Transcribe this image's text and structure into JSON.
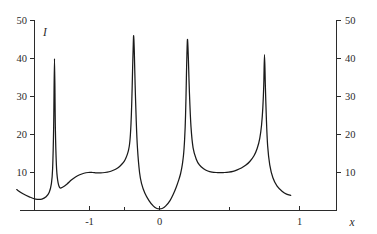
{
  "figure": {
    "title": "",
    "background_color": "#ffffff",
    "curve_color": "#1a1a1a",
    "axis_color": "#2b2b2b"
  },
  "axes": {
    "y_left": {
      "label": "I",
      "ticks": [
        "10",
        "20",
        "30",
        "40",
        "50"
      ],
      "tick_values": [
        10,
        20,
        30,
        40,
        50
      ]
    },
    "y_right": {
      "label": "",
      "ticks": [
        "10",
        "20",
        "30",
        "40",
        "50"
      ],
      "tick_values": [
        10,
        20,
        30,
        40,
        50
      ]
    },
    "x": {
      "label": "x",
      "ticks": [
        "-1",
        "0",
        "1"
      ],
      "tick_values": [
        -1,
        0,
        1
      ],
      "minor_tick_values": [
        -0.5,
        0.5
      ]
    }
  },
  "chart_data": {
    "type": "line",
    "title": "",
    "xlabel": "x",
    "ylabel": "I",
    "xlim": [
      -1.36,
      1.25
    ],
    "ylim": [
      0,
      52
    ],
    "grid": false,
    "legend": null,
    "y_axis_right_mirror": true,
    "xticks": [
      -1,
      0,
      1
    ],
    "xticklabels": [
      "-1",
      "0",
      "1"
    ],
    "xminorticks": [
      -0.5,
      0.5
    ],
    "yticks": [
      10,
      20,
      30,
      40,
      50
    ],
    "yticklabels": [
      "10",
      "20",
      "30",
      "40",
      "50"
    ],
    "peaks": [
      {
        "x": -1.0,
        "y": 40
      },
      {
        "x": -0.27,
        "y": 46
      },
      {
        "x": 0.25,
        "y": 45
      },
      {
        "x": 1.0,
        "y": 40
      }
    ],
    "minima": [
      {
        "x": -0.62,
        "y": 10
      },
      {
        "x": 0.0,
        "y": 0.5
      },
      {
        "x": 0.62,
        "y": 10
      }
    ],
    "edge_values": [
      {
        "x": -1.36,
        "y": 5.5
      },
      {
        "x": 1.25,
        "y": 4.0
      }
    ],
    "series": [
      {
        "name": "I(x)",
        "x": [
          -1.36,
          -1.3,
          -1.24,
          -1.18,
          -1.12,
          -1.08,
          -1.05,
          -1.03,
          -1.018,
          -1.008,
          -1.0,
          -0.992,
          -0.982,
          -0.97,
          -0.95,
          -0.92,
          -0.88,
          -0.84,
          -0.8,
          -0.76,
          -0.72,
          -0.68,
          -0.64,
          -0.6,
          -0.56,
          -0.52,
          -0.48,
          -0.44,
          -0.41,
          -0.38,
          -0.355,
          -0.335,
          -0.32,
          -0.305,
          -0.295,
          -0.288,
          -0.282,
          -0.277,
          -0.272,
          -0.268,
          -0.264,
          -0.26,
          -0.256,
          -0.251,
          -0.246,
          -0.24,
          -0.232,
          -0.222,
          -0.21,
          -0.19,
          -0.17,
          -0.14,
          -0.1,
          -0.06,
          -0.03,
          0.0,
          0.03,
          0.06,
          0.1,
          0.13,
          0.16,
          0.185,
          0.2,
          0.212,
          0.22,
          0.228,
          0.234,
          0.239,
          0.244,
          0.248,
          0.252,
          0.256,
          0.261,
          0.267,
          0.275,
          0.285,
          0.3,
          0.32,
          0.35,
          0.38,
          0.42,
          0.46,
          0.5,
          0.54,
          0.58,
          0.62,
          0.66,
          0.7,
          0.74,
          0.78,
          0.82,
          0.86,
          0.9,
          0.93,
          0.955,
          0.972,
          0.984,
          0.993,
          1.0,
          1.008,
          1.018,
          1.03,
          1.05,
          1.08,
          1.12,
          1.17,
          1.21,
          1.25
        ],
        "y": [
          5.5,
          4.4,
          3.6,
          3.0,
          3.0,
          3.6,
          4.8,
          7.0,
          11.0,
          22.0,
          40.0,
          22.0,
          12.0,
          8.0,
          6.0,
          6.2,
          7.0,
          8.0,
          8.8,
          9.4,
          9.8,
          10.0,
          10.0,
          9.9,
          9.9,
          10.0,
          10.2,
          10.6,
          11.0,
          11.6,
          12.3,
          13.0,
          13.8,
          14.9,
          15.9,
          16.9,
          18.3,
          20.0,
          22.5,
          25.2,
          28.6,
          32.8,
          37.5,
          42.5,
          46.0,
          42.0,
          33.0,
          24.0,
          16.5,
          10.0,
          7.0,
          4.6,
          2.6,
          1.2,
          0.6,
          0.45,
          0.6,
          1.2,
          2.6,
          4.2,
          6.2,
          8.2,
          9.6,
          11.2,
          12.6,
          14.4,
          16.4,
          18.6,
          21.6,
          25.0,
          29.4,
          34.8,
          41.0,
          45.0,
          40.0,
          31.0,
          22.0,
          16.5,
          13.5,
          12.0,
          11.0,
          10.4,
          10.1,
          10.0,
          10.0,
          10.0,
          10.1,
          10.3,
          10.7,
          11.2,
          11.9,
          12.9,
          14.4,
          16.3,
          19.0,
          22.5,
          27.0,
          33.0,
          41.0,
          33.0,
          24.0,
          17.0,
          12.0,
          8.6,
          6.4,
          5.0,
          4.3,
          4.0
        ]
      }
    ]
  }
}
